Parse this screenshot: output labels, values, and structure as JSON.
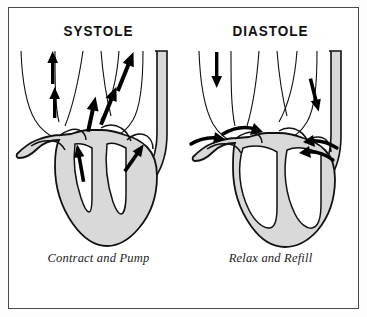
{
  "figure": {
    "name": "cardiac-cycle-diagram",
    "border_color": "#4a4a4a",
    "background_color": "#ffffff"
  },
  "style": {
    "muscle_fill": "#d9d9d9",
    "outline_color": "#111111",
    "arrow_color": "#000000",
    "chamber_fill": "#ffffff"
  },
  "panels": [
    {
      "id": "systole",
      "title": "SYSTOLE",
      "caption": "Contract and Pump",
      "phase_description": "Ventricles contracted, blood ejected upward through outflow vessels",
      "arrows": [
        {
          "name": "outflow-arrow-left-upper",
          "direction": "up"
        },
        {
          "name": "outflow-arrow-left-lower",
          "direction": "up"
        },
        {
          "name": "outflow-arrow-aorta-upper",
          "direction": "up-right"
        },
        {
          "name": "outflow-arrow-aorta-lower",
          "direction": "up-right"
        },
        {
          "name": "outflow-arrow-center",
          "direction": "up"
        },
        {
          "name": "ventricle-arrow-left",
          "direction": "up"
        },
        {
          "name": "ventricle-arrow-right",
          "direction": "up-left"
        }
      ]
    },
    {
      "id": "diastole",
      "title": "DIASTOLE",
      "caption": "Relax and Refill",
      "phase_description": "Ventricles relaxed and filling, blood flows inward from the great veins",
      "arrows": [
        {
          "name": "inflow-arrow-superior-vena-cava",
          "direction": "down"
        },
        {
          "name": "inflow-arrow-right-vessel",
          "direction": "down"
        },
        {
          "name": "inflow-arrow-left-atrium-outer",
          "direction": "curve-right"
        },
        {
          "name": "inflow-arrow-left-atrium-inner",
          "direction": "curve-right"
        },
        {
          "name": "inflow-arrow-right-atrium-outer",
          "direction": "curve-left"
        },
        {
          "name": "inflow-arrow-right-atrium-inner",
          "direction": "curve-left"
        }
      ]
    }
  ]
}
